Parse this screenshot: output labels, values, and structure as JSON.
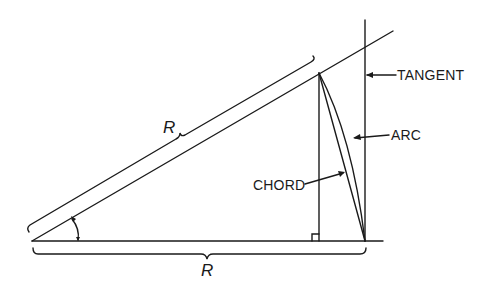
{
  "diagram": {
    "type": "geometry",
    "labels": {
      "radius_upper": "R",
      "radius_lower": "R",
      "tangent": "TANGENT",
      "arc": "ARC",
      "chord": "CHORD"
    },
    "colors": {
      "stroke": "#1a1a1a",
      "background": "#ffffff"
    }
  }
}
